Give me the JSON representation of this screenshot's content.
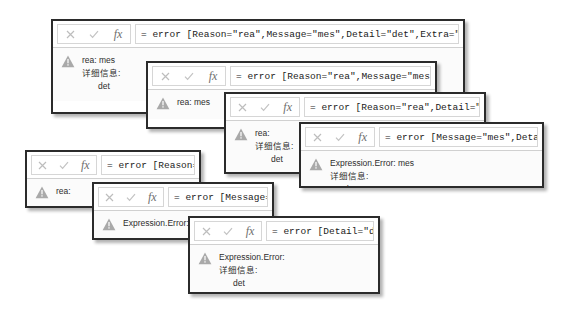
{
  "toolbar": {
    "cancel_icon": "close-icon",
    "commit_icon": "check-icon",
    "function_icon": "fx-icon",
    "function_label": "fx"
  },
  "warning_icon": "warning-triangle-icon",
  "panels": [
    {
      "id": "panel-1",
      "formula": "= error [Reason=\"rea\",Message=\"mes\",Detail=\"det\",Extra=\"ext\"]",
      "error_lines": [
        "rea: mes",
        "详细信息:",
        "det"
      ],
      "align": "center"
    },
    {
      "id": "panel-2",
      "formula": "= error [Reason=\"rea\",Message=\"mes\"]",
      "error_lines": [
        "rea: mes"
      ],
      "align": "left"
    },
    {
      "id": "panel-3",
      "formula": "= error [Reason=\"rea\",Detail=\"det\"]",
      "error_lines": [
        "rea:",
        "详细信息:",
        "det"
      ],
      "align": "center"
    },
    {
      "id": "panel-4",
      "formula": "= error [Message=\"mes\",Detail=\"det\"]",
      "error_lines": [
        "Expression.Error: mes",
        "详细信息:",
        "det"
      ],
      "align": "left"
    },
    {
      "id": "panel-5",
      "formula": "= error [Reason=\"rea\"]",
      "error_lines": [
        "rea:"
      ],
      "align": "left"
    },
    {
      "id": "panel-6",
      "formula": "= error [Message=\"mes\"]",
      "error_lines": [
        "Expression.Error: mes"
      ],
      "align": "left"
    },
    {
      "id": "panel-7",
      "formula": "= error [Detail=\"det\"]",
      "error_lines": [
        "Expression.Error:",
        "详细信息:",
        "det"
      ],
      "align": "left"
    }
  ]
}
